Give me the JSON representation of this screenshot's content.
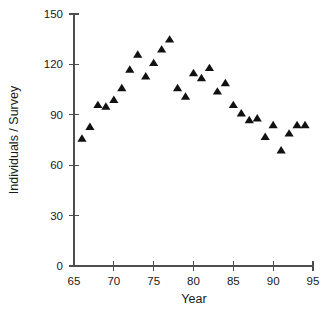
{
  "chart_data": {
    "type": "scatter",
    "title": "",
    "subtitle": "",
    "xlabel": "Year",
    "ylabel": "Individuals / Survey",
    "xlim": [
      65,
      95
    ],
    "ylim": [
      0,
      150
    ],
    "xticks": [
      65,
      70,
      75,
      80,
      85,
      90,
      95
    ],
    "xtick_labels": [
      "65",
      "70",
      "75",
      "80",
      "85",
      "90",
      "95"
    ],
    "yticks": [
      0,
      30,
      60,
      90,
      120,
      150
    ],
    "ytick_labels": [
      "0",
      "30",
      "60",
      "90",
      "120",
      "150"
    ],
    "grid": false,
    "legend": null,
    "marker": "triangle",
    "marker_color": "#111111",
    "annotations": [],
    "series": [
      {
        "name": "Individuals per Survey",
        "x": [
          66,
          67,
          68,
          69,
          70,
          71,
          72,
          73,
          74,
          75,
          76,
          77,
          78,
          79,
          80,
          81,
          82,
          83,
          84,
          85,
          86,
          87,
          88,
          89,
          90,
          91,
          92,
          93,
          94
        ],
        "y": [
          76,
          83,
          96,
          95,
          99,
          106,
          117,
          126,
          113,
          121,
          129,
          135,
          106,
          101,
          115,
          112,
          118,
          104,
          109,
          96,
          91,
          87,
          88,
          77,
          84,
          69,
          79,
          84,
          84
        ],
        "points": [
          {
            "x": 66,
            "y": 76
          },
          {
            "x": 67,
            "y": 83
          },
          {
            "x": 68,
            "y": 96
          },
          {
            "x": 69,
            "y": 95
          },
          {
            "x": 70,
            "y": 99
          },
          {
            "x": 71,
            "y": 106
          },
          {
            "x": 72,
            "y": 117
          },
          {
            "x": 73,
            "y": 126
          },
          {
            "x": 74,
            "y": 113
          },
          {
            "x": 75,
            "y": 121
          },
          {
            "x": 76,
            "y": 129
          },
          {
            "x": 77,
            "y": 135
          },
          {
            "x": 78,
            "y": 106
          },
          {
            "x": 79,
            "y": 101
          },
          {
            "x": 80,
            "y": 115
          },
          {
            "x": 81,
            "y": 112
          },
          {
            "x": 82,
            "y": 118
          },
          {
            "x": 83,
            "y": 104
          },
          {
            "x": 84,
            "y": 109
          },
          {
            "x": 85,
            "y": 96
          },
          {
            "x": 86,
            "y": 91
          },
          {
            "x": 87,
            "y": 87
          },
          {
            "x": 88,
            "y": 88
          },
          {
            "x": 89,
            "y": 77
          },
          {
            "x": 90,
            "y": 84
          },
          {
            "x": 91,
            "y": 69
          },
          {
            "x": 92,
            "y": 79
          },
          {
            "x": 93,
            "y": 84
          },
          {
            "x": 94,
            "y": 84
          }
        ]
      }
    ]
  },
  "figure": {
    "axis_color": "#4d4d4d",
    "background": "#ffffff",
    "text_color": "#1a1a1a"
  }
}
